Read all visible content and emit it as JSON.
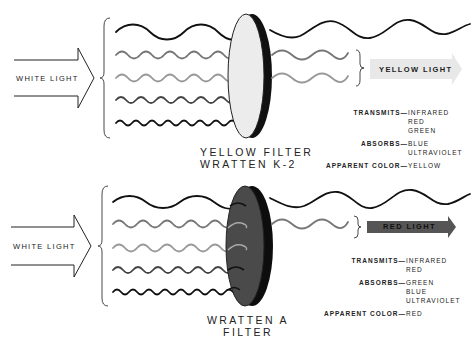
{
  "colors": {
    "background": "#ffffff",
    "ink": "#1a1a1a",
    "yellow_filter_face": "#ececec",
    "red_filter_face": "#4a4a4a",
    "yellow_arrow_fill": "#e8e8e8",
    "red_arrow_fill": "#555555",
    "wave_infrared": "#111111",
    "wave_red": "#777777",
    "wave_green": "#999999",
    "wave_blue": "#444444",
    "wave_ultraviolet": "#111111"
  },
  "panels": [
    {
      "id": "yellow",
      "input_label": "WHITE LIGHT",
      "filter_name_line1": "YELLOW FILTER",
      "filter_name_line2": "WRATTEN K-2",
      "output_label": "YELLOW LIGHT",
      "transmits_key": "TRANSMITS—",
      "transmits": [
        "INFRARED",
        "RED",
        "GREEN"
      ],
      "absorbs_key": "ABSORBS—",
      "absorbs": [
        "BLUE",
        "ULTRAVIOLET"
      ],
      "apparent_key": "APPARENT COLOR—",
      "apparent": "YELLOW"
    },
    {
      "id": "red",
      "input_label": "WHITE LIGHT",
      "filter_name_line1": "WRATTEN A",
      "filter_name_line2": "FILTER",
      "output_label": "RED LIGHT",
      "transmits_key": "TRANSMITS—",
      "transmits": [
        "INFRARED",
        "RED"
      ],
      "absorbs_key": "ABSORBS—",
      "absorbs": [
        "GREEN",
        "BLUE",
        "ULTRAVIOLET"
      ],
      "apparent_key": "APPARENT COLOR—",
      "apparent": "RED"
    }
  ],
  "wave_bands": [
    "infrared",
    "red",
    "green",
    "blue",
    "ultraviolet"
  ]
}
